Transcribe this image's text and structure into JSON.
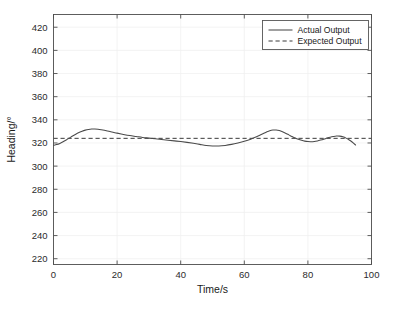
{
  "chart_data": {
    "type": "line",
    "title": "",
    "xlabel": "Time/s",
    "ylabel": "Heading/°",
    "xlim": [
      0,
      100
    ],
    "ylim": [
      215,
      431
    ],
    "xticks": [
      0,
      20,
      40,
      60,
      80,
      100
    ],
    "yticks": [
      220,
      240,
      260,
      280,
      300,
      320,
      340,
      360,
      380,
      400,
      420
    ],
    "xtick_labels": [
      "0",
      "20",
      "40",
      "60",
      "80",
      "100"
    ],
    "ytick_labels": [
      "220",
      "240",
      "260",
      "280",
      "300",
      "320",
      "340",
      "360",
      "380",
      "400",
      "420"
    ],
    "grid": true,
    "legend_position": "top-right",
    "series": [
      {
        "name": "Actual Output",
        "style": "solid",
        "color": "#4a4a4a",
        "x": [
          0,
          1,
          2,
          3,
          4,
          5,
          6,
          7,
          8,
          9,
          10,
          11,
          12,
          13,
          14,
          15,
          16,
          17,
          18,
          19,
          20,
          22,
          24,
          26,
          28,
          30,
          32,
          34,
          36,
          38,
          40,
          42,
          44,
          46,
          48,
          50,
          52,
          54,
          56,
          58,
          60,
          62,
          64,
          65,
          66,
          67,
          68,
          69,
          70,
          71,
          72,
          73,
          74,
          75,
          76,
          77,
          78,
          79,
          80,
          81,
          82,
          83,
          84,
          85,
          86,
          87,
          88,
          89,
          90,
          91,
          92,
          93,
          94,
          95
        ],
        "y": [
          318.0,
          318.6,
          319.6,
          321.0,
          322.6,
          324.3,
          326.0,
          327.6,
          329.0,
          330.2,
          331.1,
          331.7,
          332.0,
          332.0,
          331.8,
          331.4,
          330.9,
          330.3,
          329.7,
          329.1,
          328.5,
          327.4,
          326.4,
          325.6,
          324.8,
          324.2,
          323.6,
          323.0,
          322.4,
          321.8,
          321.2,
          320.5,
          319.7,
          318.8,
          317.9,
          317.4,
          317.4,
          317.9,
          318.8,
          320.0,
          321.4,
          323.2,
          325.6,
          326.9,
          328.2,
          329.5,
          330.6,
          331.2,
          331.2,
          330.7,
          329.7,
          328.4,
          327.0,
          325.6,
          324.3,
          323.2,
          322.3,
          321.6,
          321.2,
          321.1,
          321.3,
          321.8,
          322.5,
          323.3,
          324.2,
          325.0,
          325.6,
          326.0,
          325.9,
          325.3,
          324.2,
          322.6,
          320.6,
          318.2
        ]
      },
      {
        "name": "Expected Output",
        "style": "dashed",
        "color": "#3a3a3a",
        "x": [
          0,
          100
        ],
        "y": [
          324.0,
          324.0
        ]
      }
    ]
  },
  "legend": {
    "entries": [
      {
        "label": "Actual Output",
        "style": "solid"
      },
      {
        "label": "Expected Output",
        "style": "dashed"
      }
    ]
  },
  "axes": {
    "xlabel": "Time/s",
    "ylabel": "Heading/°"
  }
}
